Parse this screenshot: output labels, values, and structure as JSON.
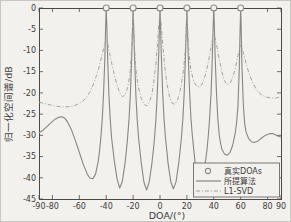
{
  "figure": {
    "background": "#f2f1ee",
    "axis_color": "#4a4a4a",
    "text_color": "#3c3c3c",
    "solid_color": "#868686",
    "dashed_color": "#a2a2a2",
    "marker_color": "#8c8c8c"
  },
  "chart_data": {
    "type": "line",
    "title": "",
    "xlabel": "DOA/(°)",
    "ylabel": "归一化空间谱/dB",
    "xlim": [
      -90,
      90
    ],
    "ylim": [
      -45,
      0
    ],
    "x_tick_values": [
      -90,
      -80,
      -60,
      -40,
      -20,
      0,
      20,
      40,
      60,
      80,
      90
    ],
    "x_tick_labels": [
      "-90",
      "-80",
      "-60",
      "-40",
      "-20",
      "0",
      "20",
      "40",
      "60",
      "80",
      "90"
    ],
    "y_tick_values": [
      0,
      -5,
      -10,
      -15,
      -20,
      -25,
      -30,
      -35,
      -40,
      -45
    ],
    "y_tick_labels": [
      "0",
      "-5",
      "-10",
      "-15",
      "-20",
      "-25",
      "-30",
      "-35",
      "-40",
      "-45"
    ],
    "grid": false,
    "legend_position": "lower-right",
    "true_doas": {
      "label": "真实DOAs",
      "marker": "circle",
      "x": [
        -40,
        -20,
        0,
        20,
        40,
        60
      ],
      "y_db": 0
    },
    "series": [
      {
        "name": "所提算法",
        "line_style": "solid",
        "points": [
          [
            -90,
            -29.4
          ],
          [
            -87,
            -28.8
          ],
          [
            -84,
            -27.9
          ],
          [
            -81,
            -27.0
          ],
          [
            -78,
            -26.2
          ],
          [
            -75,
            -25.7
          ],
          [
            -73,
            -25.6
          ],
          [
            -71,
            -25.9
          ],
          [
            -69,
            -26.7
          ],
          [
            -66,
            -28.6
          ],
          [
            -63,
            -31.2
          ],
          [
            -60,
            -34.0
          ],
          [
            -57,
            -36.9
          ],
          [
            -54,
            -39.2
          ],
          [
            -52,
            -40.1
          ],
          [
            -50,
            -40.2
          ],
          [
            -48,
            -39.2
          ],
          [
            -46,
            -36.2
          ],
          [
            -45,
            -33.8
          ],
          [
            -44,
            -30.6
          ],
          [
            -43,
            -26.4
          ],
          [
            -42,
            -20.5
          ],
          [
            -41,
            -11.5
          ],
          [
            -40.4,
            -4
          ],
          [
            -40,
            0
          ],
          [
            -39.6,
            -4
          ],
          [
            -39,
            -11.5
          ],
          [
            -38,
            -20.5
          ],
          [
            -37,
            -26.4
          ],
          [
            -36,
            -30.6
          ],
          [
            -34,
            -36.0
          ],
          [
            -32,
            -40.2
          ],
          [
            -30,
            -42.4
          ],
          [
            -28,
            -40.8
          ],
          [
            -26,
            -36.6
          ],
          [
            -25,
            -33.6
          ],
          [
            -24,
            -30.2
          ],
          [
            -23,
            -26.0
          ],
          [
            -22,
            -20.0
          ],
          [
            -21,
            -11.0
          ],
          [
            -20.4,
            -4
          ],
          [
            -20,
            0
          ],
          [
            -19.6,
            -4
          ],
          [
            -19,
            -11.0
          ],
          [
            -18,
            -20.0
          ],
          [
            -17,
            -26.0
          ],
          [
            -16,
            -30.4
          ],
          [
            -14,
            -36.4
          ],
          [
            -12,
            -41.0
          ],
          [
            -10,
            -42.9
          ],
          [
            -8,
            -41.0
          ],
          [
            -6,
            -36.6
          ],
          [
            -5,
            -33.6
          ],
          [
            -4,
            -30.4
          ],
          [
            -3,
            -26.0
          ],
          [
            -2,
            -20.0
          ],
          [
            -1,
            -11.0
          ],
          [
            -0.4,
            -4
          ],
          [
            0,
            0
          ],
          [
            0.4,
            -4
          ],
          [
            1,
            -11.0
          ],
          [
            2,
            -20.0
          ],
          [
            3,
            -26.0
          ],
          [
            4,
            -30.4
          ],
          [
            6,
            -36.6
          ],
          [
            8,
            -41.0
          ],
          [
            10,
            -42.6
          ],
          [
            12,
            -40.9
          ],
          [
            14,
            -36.4
          ],
          [
            16,
            -30.4
          ],
          [
            17,
            -26.0
          ],
          [
            18,
            -20.0
          ],
          [
            19,
            -11.0
          ],
          [
            19.6,
            -4
          ],
          [
            20,
            0
          ],
          [
            20.4,
            -4
          ],
          [
            21,
            -11.0
          ],
          [
            22,
            -19.8
          ],
          [
            23,
            -25.8
          ],
          [
            24,
            -30.0
          ],
          [
            26,
            -36.2
          ],
          [
            28,
            -40.0
          ],
          [
            30,
            -41.9
          ],
          [
            32,
            -40.0
          ],
          [
            34,
            -35.8
          ],
          [
            35,
            -33.2
          ],
          [
            36,
            -29.8
          ],
          [
            37,
            -25.6
          ],
          [
            38,
            -20.0
          ],
          [
            39,
            -11.0
          ],
          [
            39.6,
            -4
          ],
          [
            40,
            0
          ],
          [
            40.4,
            -4
          ],
          [
            41,
            -11.0
          ],
          [
            42,
            -20.0
          ],
          [
            43,
            -26.0
          ],
          [
            44,
            -29.8
          ],
          [
            45,
            -31.8
          ],
          [
            46,
            -33.2
          ],
          [
            48,
            -34.4
          ],
          [
            50,
            -34.7
          ],
          [
            52,
            -34.1
          ],
          [
            54,
            -32.4
          ],
          [
            56,
            -29.4
          ],
          [
            57,
            -27.0
          ],
          [
            58,
            -23.0
          ],
          [
            59,
            -14.0
          ],
          [
            59.6,
            -5
          ],
          [
            60,
            0
          ],
          [
            60.4,
            -5
          ],
          [
            61,
            -14.0
          ],
          [
            62,
            -23.0
          ],
          [
            63,
            -27.2
          ],
          [
            64,
            -29.2
          ],
          [
            66,
            -30.8
          ],
          [
            68,
            -31.5
          ],
          [
            70,
            -31.7
          ],
          [
            73,
            -31.3
          ],
          [
            76,
            -30.5
          ],
          [
            79,
            -29.9
          ],
          [
            82,
            -29.6
          ],
          [
            84,
            -29.6
          ],
          [
            86,
            -29.9
          ],
          [
            88,
            -30.2
          ],
          [
            90,
            -30.4
          ]
        ]
      },
      {
        "name": "L1-SVD",
        "line_style": "dash-dot",
        "points": [
          [
            -90,
            -22.2
          ],
          [
            -86,
            -22.5
          ],
          [
            -82,
            -22.8
          ],
          [
            -78,
            -23.1
          ],
          [
            -74,
            -23.3
          ],
          [
            -70,
            -23.3
          ],
          [
            -66,
            -23.2
          ],
          [
            -62,
            -22.8
          ],
          [
            -58,
            -22.1
          ],
          [
            -55,
            -21.2
          ],
          [
            -52,
            -19.7
          ],
          [
            -49,
            -17.5
          ],
          [
            -46,
            -14.7
          ],
          [
            -44,
            -12.3
          ],
          [
            -42,
            -9.6
          ],
          [
            -41,
            -8.3
          ],
          [
            -40,
            -7.4
          ],
          [
            -39,
            -8.3
          ],
          [
            -38,
            -9.9
          ],
          [
            -36,
            -12.9
          ],
          [
            -34,
            -15.7
          ],
          [
            -32,
            -18.1
          ],
          [
            -30,
            -20.0
          ],
          [
            -28,
            -20.9
          ],
          [
            -26,
            -20.5
          ],
          [
            -24,
            -18.7
          ],
          [
            -22.5,
            -15.8
          ],
          [
            -21.5,
            -12.0
          ],
          [
            -20.7,
            -6.5
          ],
          [
            -20,
            -1.2
          ],
          [
            -19.3,
            -6.5
          ],
          [
            -18.5,
            -12.0
          ],
          [
            -17.5,
            -15.8
          ],
          [
            -16,
            -18.7
          ],
          [
            -14,
            -21.3
          ],
          [
            -12,
            -22.7
          ],
          [
            -10,
            -23.1
          ],
          [
            -8,
            -22.3
          ],
          [
            -6,
            -20.3
          ],
          [
            -4.5,
            -17.2
          ],
          [
            -3,
            -13.0
          ],
          [
            -1.8,
            -8.0
          ],
          [
            -0.8,
            -3.5
          ],
          [
            0,
            -1.0
          ],
          [
            0.8,
            -3.5
          ],
          [
            2,
            -8.5
          ],
          [
            3.5,
            -13.8
          ],
          [
            5,
            -17.5
          ],
          [
            7,
            -20.8
          ],
          [
            9,
            -22.4
          ],
          [
            11,
            -22.7
          ],
          [
            13,
            -21.7
          ],
          [
            15,
            -19.5
          ],
          [
            17,
            -15.8
          ],
          [
            18.5,
            -11.2
          ],
          [
            19.4,
            -5.5
          ],
          [
            20,
            -1.8
          ],
          [
            20.6,
            -5.5
          ],
          [
            21.6,
            -10.8
          ],
          [
            23,
            -14.6
          ],
          [
            25,
            -17.2
          ],
          [
            27,
            -18.4
          ],
          [
            29,
            -18.6
          ],
          [
            31,
            -18.1
          ],
          [
            33,
            -16.5
          ],
          [
            35,
            -14.2
          ],
          [
            37,
            -11.0
          ],
          [
            38.5,
            -8.2
          ],
          [
            39.5,
            -6.6
          ],
          [
            40,
            -6.4
          ],
          [
            41,
            -7.1
          ],
          [
            42.5,
            -9.3
          ],
          [
            44,
            -12.0
          ],
          [
            46,
            -15.0
          ],
          [
            48,
            -17.2
          ],
          [
            50,
            -18.1
          ],
          [
            52,
            -17.8
          ],
          [
            54,
            -16.4
          ],
          [
            56,
            -14.2
          ],
          [
            58,
            -11.2
          ],
          [
            59.4,
            -9.1
          ],
          [
            60,
            -8.8
          ],
          [
            60.6,
            -9.2
          ],
          [
            62,
            -10.6
          ],
          [
            64,
            -13.0
          ],
          [
            66,
            -15.2
          ],
          [
            69,
            -17.7
          ],
          [
            72,
            -19.4
          ],
          [
            75,
            -20.3
          ],
          [
            78,
            -20.9
          ],
          [
            82,
            -21.2
          ],
          [
            86,
            -21.2
          ],
          [
            90,
            -20.9
          ]
        ]
      }
    ]
  },
  "legend": {
    "entries": [
      {
        "label": "真实DOAs",
        "symbol": "circle-marker"
      },
      {
        "label": "所提算法",
        "symbol": "solid-line"
      },
      {
        "label": "L1-SVD",
        "symbol": "dash-dot-line"
      }
    ]
  }
}
